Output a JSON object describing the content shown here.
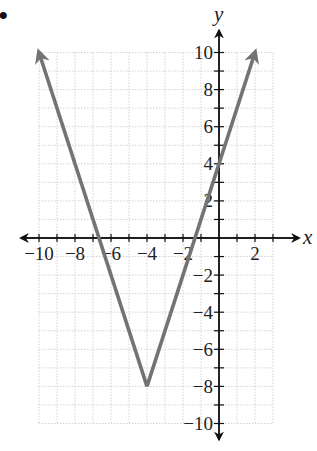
{
  "bullet": "•",
  "chart_data": {
    "type": "line",
    "title": "",
    "xlabel": "x",
    "ylabel": "y",
    "xlim": [
      -10,
      3
    ],
    "ylim": [
      -10,
      10
    ],
    "grid": true,
    "x_ticks": [
      -10,
      -8,
      -6,
      -4,
      -2,
      2
    ],
    "x_tick_labels": [
      "−10",
      "−8",
      "−6",
      "−4",
      "−2",
      "2"
    ],
    "y_ticks": [
      10,
      8,
      6,
      4,
      2,
      -2,
      -4,
      -6,
      -8,
      -10
    ],
    "y_tick_labels": [
      "10",
      "8",
      "6",
      "4",
      "2",
      "−2",
      "−4",
      "−6",
      "−8",
      "−10"
    ],
    "series": [
      {
        "name": "y = 3|x + 4| − 8",
        "color": "#737373",
        "x": [
          -10,
          -4,
          2
        ],
        "y": [
          10,
          -8,
          10
        ],
        "arrows_at_ends": true
      }
    ],
    "vertex": [
      -4,
      -8
    ]
  }
}
